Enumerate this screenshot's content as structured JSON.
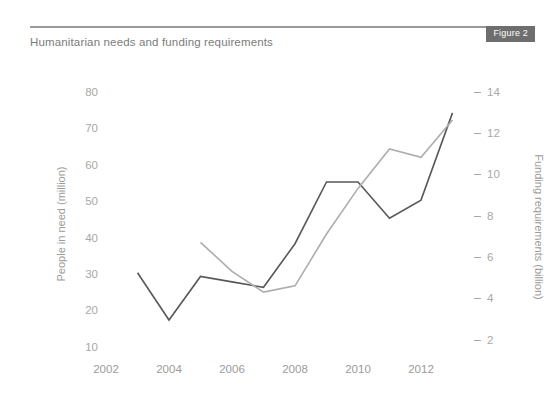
{
  "header": {
    "title": "Humanitarian needs and funding requirements",
    "badge": "Figure 2",
    "badge_color": "#6e6e6e",
    "rule_color": "#9a9a9a",
    "title_color": "#7b7b7b"
  },
  "chart_data": {
    "type": "line",
    "title": "Humanitarian needs and funding requirements",
    "xlabel": "",
    "ylabel": "People in need (million)",
    "y2label": "Funding requirements (billion)",
    "grid": false,
    "legend": "none",
    "xlim": [
      2001.5,
      2013.5
    ],
    "ylim": [
      5,
      85
    ],
    "y2lim": [
      0.8,
      14.7
    ],
    "xticks": [
      "2002",
      "2004",
      "2006",
      "2008",
      "2010",
      "2012"
    ],
    "xtick_values": [
      2002,
      2004,
      2006,
      2008,
      2010,
      2012
    ],
    "yticks": [
      "10",
      "20",
      "30",
      "40",
      "50",
      "60",
      "70",
      "80"
    ],
    "ytick_values": [
      10,
      20,
      30,
      40,
      50,
      60,
      70,
      80
    ],
    "y2ticks": [
      "2",
      "4",
      "6",
      "8",
      "10",
      "12",
      "14"
    ],
    "y2tick_values": [
      2,
      4,
      6,
      8,
      10,
      12,
      14
    ],
    "series": [
      {
        "name": "People in need (million)",
        "axis": "left",
        "color": "#585858",
        "x": [
          2003,
          2004,
          2005,
          2006,
          2007,
          2008,
          2009,
          2010,
          2011,
          2012,
          2013
        ],
        "values": [
          30,
          17,
          29,
          27.5,
          26,
          38,
          55,
          55,
          45,
          50,
          74
        ]
      },
      {
        "name": "Funding requirements (billion)",
        "axis": "right",
        "color": "#adadad",
        "x": [
          2005,
          2006,
          2007,
          2008,
          2009,
          2010,
          2011,
          2012,
          2013
        ],
        "values": [
          6.9,
          5.5,
          4.5,
          4.8,
          7.3,
          9.5,
          11.4,
          11.0,
          12.8
        ]
      }
    ]
  },
  "axes": {
    "left_tick_color": "#a8a8a8",
    "right_tick_color": "#a8a8a8",
    "x_tick_color": "#9b9b9b"
  }
}
